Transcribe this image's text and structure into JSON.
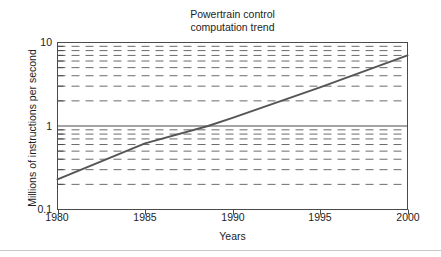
{
  "chart_data": {
    "type": "line",
    "title": "Powertrain control\ncomputation trend",
    "title_line1": "Powertrain control",
    "title_line2": "computation trend",
    "xlabel": "Years",
    "ylabel": "Millions of instructions per second",
    "yscale": "log",
    "xlim": [
      1980,
      2000
    ],
    "ylim": [
      0.1,
      10
    ],
    "grid": "horizontal-dashed-minor-and-major",
    "legend": "none",
    "x_ticks": [
      1980,
      1985,
      1990,
      1995,
      2000
    ],
    "x_tick_labels": [
      "1980",
      "1985",
      "1990",
      "1995",
      "2000"
    ],
    "y_ticks": [
      0.1,
      1,
      10
    ],
    "y_tick_labels": [
      "0.1",
      "1",
      "10"
    ],
    "y_minor_gridlines": [
      0.2,
      0.3,
      0.4,
      0.5,
      0.6,
      0.7,
      0.8,
      0.9,
      2,
      3,
      4,
      5,
      6,
      7,
      8,
      9
    ],
    "series": [
      {
        "name": "Powertrain control computation trend",
        "color": "#555555",
        "x": [
          1980,
          1985,
          1988.6,
          1990,
          1995,
          2000
        ],
        "values": [
          0.23,
          0.62,
          1.0,
          1.25,
          2.9,
          7.0
        ]
      }
    ]
  },
  "axes": {
    "x_tick_labels": [
      "1980",
      "1985",
      "1990",
      "1995",
      "2000"
    ],
    "y_tick_labels": [
      "10",
      "1",
      "0.1"
    ]
  },
  "colors": {
    "line": "#555555",
    "grid": "#6b6b6b",
    "axis": "#4a4a4a",
    "text": "#1d1d1d",
    "background": "#ffffff",
    "footer_rule": "#c9c9c9"
  }
}
